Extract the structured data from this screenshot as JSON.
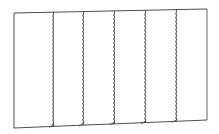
{
  "diagram": {
    "stroke_color": "#3a3a3a",
    "fill_color": "#ffffff",
    "panel_count": 6,
    "panels": [
      {
        "index": 1,
        "x_left": 14,
        "x_right": 53
      },
      {
        "index": 2,
        "x_left": 53,
        "x_right": 83
      },
      {
        "index": 3,
        "x_left": 83,
        "x_right": 114
      },
      {
        "index": 4,
        "x_left": 114,
        "x_right": 145
      },
      {
        "index": 5,
        "x_left": 145,
        "x_right": 176
      },
      {
        "index": 6,
        "x_left": 176,
        "x_right": 207
      }
    ]
  }
}
